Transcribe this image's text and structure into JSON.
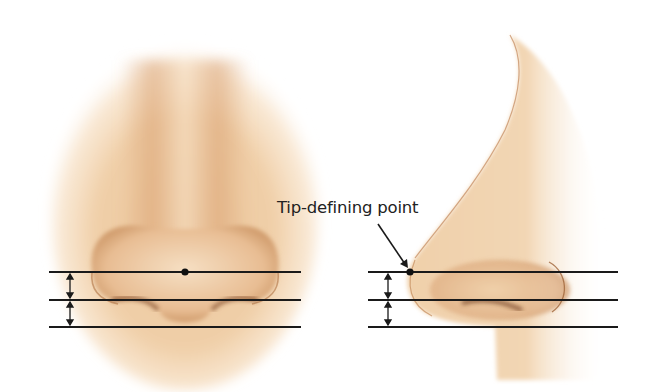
{
  "figure": {
    "annotation": "Tip-defining point",
    "colors": {
      "skin_light": "#f3d9b8",
      "skin_mid": "#e2b48a",
      "skin_shadow": "#a36a3f",
      "nostril": "#6e3a1c",
      "line": "#1a1a1a",
      "background": "#ffffff"
    },
    "views": [
      {
        "name": "frontal-view",
        "dot": {
          "x": 185,
          "y": 272
        },
        "lines_x": [
          49,
          301
        ]
      },
      {
        "name": "lateral-view",
        "dot": {
          "x": 410,
          "y": 272
        },
        "lines_x": [
          368,
          618
        ]
      }
    ],
    "reference_lines_y": [
      272,
      300,
      327
    ],
    "dimension_arrows": [
      {
        "view": "frontal",
        "x": 70,
        "segments": [
          [
            272,
            300
          ],
          [
            300,
            327
          ]
        ]
      },
      {
        "view": "lateral",
        "x": 388,
        "segments": [
          [
            272,
            300
          ],
          [
            300,
            327
          ]
        ]
      }
    ]
  }
}
